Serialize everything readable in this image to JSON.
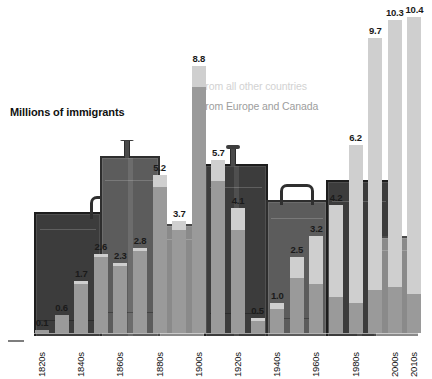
{
  "title": "Millions of immigrants",
  "legend": {
    "other": "From all other countries",
    "europe": "From Europe and Canada",
    "other_color": "#cfcfcf",
    "europe_color": "#9a9a9a"
  },
  "chart_data": {
    "type": "bar",
    "title": "Millions of immigrants",
    "xlabel": "",
    "ylabel": "Millions of immigrants",
    "ylim": [
      0,
      10.4
    ],
    "grid": false,
    "legend_position": "inside-top-right",
    "stacked": true,
    "categories": [
      "1820s",
      "1830s",
      "1840s",
      "1850s",
      "1860s",
      "1870s",
      "1880s",
      "1890s",
      "1900s",
      "1910s",
      "1920s",
      "1930s",
      "1940s",
      "1950s",
      "1960s",
      "1970s",
      "1980s",
      "1990s",
      "2000s",
      "2010s"
    ],
    "tick_labels": [
      "1820s",
      "1840s",
      "1860s",
      "1880s",
      "1900s",
      "1920s",
      "1940s",
      "1960s",
      "1980s",
      "2000s",
      "2010s"
    ],
    "values": [
      0.1,
      0.6,
      1.7,
      2.6,
      2.3,
      2.8,
      5.2,
      3.7,
      8.8,
      5.7,
      4.1,
      0.5,
      1.0,
      2.5,
      3.2,
      4.2,
      6.2,
      9.7,
      10.3,
      10.4
    ],
    "data_labels": [
      "0.1",
      "0.6",
      "1.7",
      "2.6",
      "2.3",
      "2.8",
      "5.2",
      "3.7",
      "8.8",
      "5.7",
      "4.1",
      "0.5",
      "1.0",
      "2.5",
      "3.2",
      "4.2",
      "6.2",
      "9.7",
      "10.3",
      "10.4"
    ],
    "series": [
      {
        "name": "From Europe and Canada",
        "color": "#9a9a9a",
        "values": [
          0.1,
          0.6,
          1.6,
          2.5,
          2.2,
          2.7,
          4.8,
          3.4,
          8.1,
          5.0,
          3.4,
          0.4,
          0.8,
          1.8,
          1.6,
          1.2,
          1.0,
          1.4,
          1.5,
          1.3
        ]
      },
      {
        "name": "From all other countries",
        "color": "#cfcfcf",
        "values": [
          0.0,
          0.0,
          0.1,
          0.1,
          0.1,
          0.1,
          0.4,
          0.3,
          0.7,
          0.7,
          0.7,
          0.1,
          0.2,
          0.7,
          1.6,
          3.0,
          5.2,
          8.3,
          8.8,
          9.1
        ]
      }
    ]
  }
}
